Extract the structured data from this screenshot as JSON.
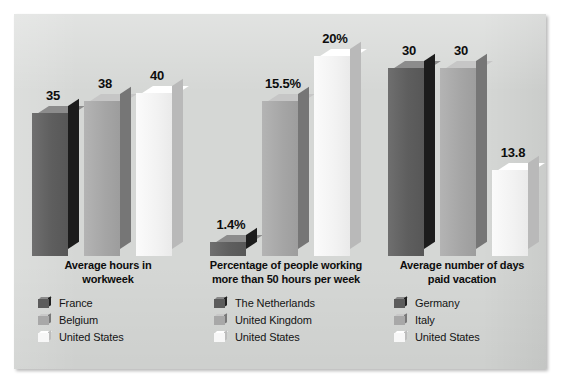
{
  "chart_data": {
    "type": "bar",
    "title": "",
    "subtitle": "",
    "xlabel": "",
    "ylabel": "",
    "grid": false,
    "legend_position": "below-each-group",
    "style": "3d-grouped-bars",
    "panel_background": "#d5d7d5",
    "series_colors": [
      "#5e5e5e",
      "#a5a5a5",
      "#f2f2f2"
    ],
    "groups": [
      {
        "title_line1": "Average hours in",
        "title_line2": "workweek",
        "unit": "hours",
        "categories": [
          "France",
          "Belgium",
          "United States"
        ],
        "values": [
          35,
          38,
          40
        ],
        "value_labels": [
          "35",
          "38",
          "40"
        ],
        "ymax": 40
      },
      {
        "title_line1": "Percentage of people working",
        "title_line2": "more than 50 hours per week",
        "unit": "percent",
        "categories": [
          "The Netherlands",
          "United Kingdom",
          "United States"
        ],
        "values": [
          1.4,
          15.5,
          20
        ],
        "value_labels": [
          "1.4%",
          "15.5%",
          "20%"
        ],
        "ymax": 20
      },
      {
        "title_line1": "Average number of days",
        "title_line2": "paid vacation",
        "unit": "days",
        "categories": [
          "Germany",
          "Italy",
          "United States"
        ],
        "values": [
          30,
          30,
          13.8
        ],
        "value_labels": [
          "30",
          "30",
          "13.8"
        ],
        "ymax": 30
      }
    ]
  }
}
